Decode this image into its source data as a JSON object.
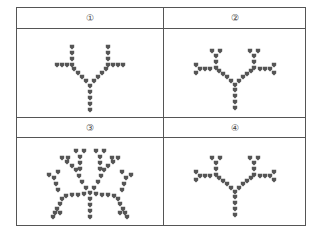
{
  "table": {
    "options": [
      {
        "label": "①",
        "beads": [
          [
            90,
            110
          ],
          [
            90,
            104
          ],
          [
            90,
            98
          ],
          [
            90,
            92
          ],
          [
            90,
            86
          ],
          [
            86,
            81
          ],
          [
            82,
            77
          ],
          [
            78,
            73
          ],
          [
            74,
            69
          ],
          [
            72,
            65
          ],
          [
            72,
            59
          ],
          [
            72,
            53
          ],
          [
            72,
            47
          ],
          [
            67,
            65
          ],
          [
            62,
            65
          ],
          [
            57,
            65
          ],
          [
            94,
            81
          ],
          [
            98,
            77
          ],
          [
            102,
            73
          ],
          [
            106,
            69
          ],
          [
            108,
            65
          ],
          [
            108,
            59
          ],
          [
            108,
            53
          ],
          [
            108,
            47
          ],
          [
            113,
            65
          ],
          [
            118,
            65
          ],
          [
            123,
            65
          ]
        ]
      },
      {
        "label": "②",
        "beads": [
          [
            235,
            108
          ],
          [
            235,
            102
          ],
          [
            235,
            96
          ],
          [
            235,
            90
          ],
          [
            235,
            85
          ],
          [
            231,
            81
          ],
          [
            227,
            77
          ],
          [
            223,
            74
          ],
          [
            219,
            71
          ],
          [
            216,
            68
          ],
          [
            216,
            62
          ],
          [
            216,
            56
          ],
          [
            212,
            51
          ],
          [
            220,
            51
          ],
          [
            210,
            69
          ],
          [
            205,
            69
          ],
          [
            200,
            69
          ],
          [
            196,
            65
          ],
          [
            196,
            73
          ],
          [
            239,
            81
          ],
          [
            243,
            77
          ],
          [
            247,
            74
          ],
          [
            251,
            71
          ],
          [
            254,
            68
          ],
          [
            254,
            62
          ],
          [
            254,
            56
          ],
          [
            250,
            51
          ],
          [
            258,
            51
          ],
          [
            260,
            69
          ],
          [
            265,
            69
          ],
          [
            270,
            69
          ],
          [
            274,
            65
          ],
          [
            274,
            73
          ]
        ]
      },
      {
        "label": "③",
        "beads": [
          [
            90,
            217
          ],
          [
            90,
            211
          ],
          [
            90,
            205
          ],
          [
            90,
            199
          ],
          [
            90,
            193
          ],
          [
            84,
            194
          ],
          [
            78,
            195
          ],
          [
            72,
            195
          ],
          [
            66,
            196
          ],
          [
            62,
            199
          ],
          [
            60,
            204
          ],
          [
            57,
            209
          ],
          [
            55,
            213
          ],
          [
            53,
            217
          ],
          [
            60,
            213
          ],
          [
            58,
            190
          ],
          [
            56,
            184
          ],
          [
            54,
            178
          ],
          [
            49,
            175
          ],
          [
            58,
            172
          ],
          [
            86,
            188
          ],
          [
            82,
            182
          ],
          [
            79,
            176
          ],
          [
            76,
            170
          ],
          [
            72,
            166
          ],
          [
            67,
            162
          ],
          [
            62,
            158
          ],
          [
            68,
            158
          ],
          [
            80,
            169
          ],
          [
            80,
            163
          ],
          [
            80,
            157
          ],
          [
            76,
            151
          ],
          [
            84,
            151
          ],
          [
            96,
            194
          ],
          [
            102,
            195
          ],
          [
            108,
            195
          ],
          [
            114,
            196
          ],
          [
            118,
            199
          ],
          [
            120,
            204
          ],
          [
            123,
            209
          ],
          [
            125,
            213
          ],
          [
            127,
            217
          ],
          [
            120,
            213
          ],
          [
            122,
            190
          ],
          [
            124,
            184
          ],
          [
            126,
            178
          ],
          [
            131,
            175
          ],
          [
            122,
            172
          ],
          [
            94,
            188
          ],
          [
            98,
            182
          ],
          [
            101,
            176
          ],
          [
            104,
            170
          ],
          [
            108,
            166
          ],
          [
            113,
            162
          ],
          [
            118,
            158
          ],
          [
            112,
            158
          ],
          [
            100,
            169
          ],
          [
            100,
            163
          ],
          [
            100,
            157
          ],
          [
            96,
            151
          ],
          [
            104,
            151
          ]
        ]
      },
      {
        "label": "④",
        "beads": [
          [
            235,
            215
          ],
          [
            235,
            209
          ],
          [
            235,
            203
          ],
          [
            235,
            197
          ],
          [
            235,
            192
          ],
          [
            231,
            188
          ],
          [
            227,
            184
          ],
          [
            223,
            181
          ],
          [
            219,
            178
          ],
          [
            216,
            175
          ],
          [
            216,
            169
          ],
          [
            216,
            163
          ],
          [
            212,
            158
          ],
          [
            220,
            158
          ],
          [
            210,
            176
          ],
          [
            205,
            176
          ],
          [
            200,
            176
          ],
          [
            196,
            172
          ],
          [
            196,
            180
          ],
          [
            239,
            188
          ],
          [
            243,
            184
          ],
          [
            247,
            181
          ],
          [
            251,
            178
          ],
          [
            254,
            175
          ],
          [
            254,
            169
          ],
          [
            254,
            163
          ],
          [
            250,
            158
          ],
          [
            258,
            158
          ],
          [
            260,
            176
          ],
          [
            265,
            176
          ],
          [
            270,
            176
          ],
          [
            274,
            172
          ],
          [
            274,
            180
          ]
        ]
      }
    ],
    "bead_color": "#555555",
    "border_color": "#555555"
  }
}
